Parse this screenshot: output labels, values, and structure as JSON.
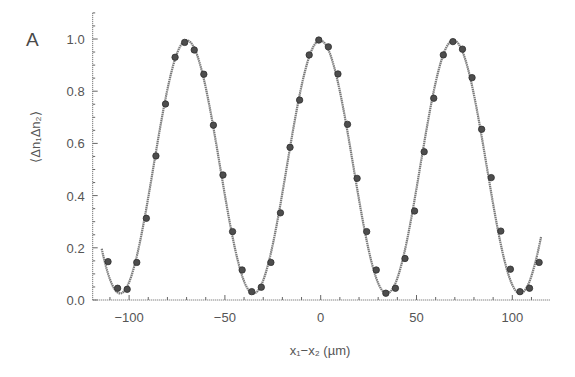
{
  "panel_label": "A",
  "chart_data": {
    "type": "scatter",
    "title": "",
    "xlabel": "x₁−x₂ (µm)",
    "ylabel": "⟨Δn₁Δn₂⟩",
    "xlim": [
      -119,
      120
    ],
    "ylim": [
      0,
      1.1
    ],
    "grid": false,
    "legend": null,
    "x_ticks": [
      -100,
      -50,
      0,
      50,
      100
    ],
    "x_tick_labels": [
      "−100",
      "−50",
      "0",
      "50",
      "100"
    ],
    "y_ticks": [
      0.0,
      0.2,
      0.4,
      0.6,
      0.8,
      1.0
    ],
    "y_tick_labels": [
      "0.0",
      "0.2",
      "0.4",
      "0.6",
      "0.8",
      "1.0"
    ],
    "series": [
      {
        "name": "measured",
        "style": "markers",
        "x": [
          -111,
          -106,
          -101,
          -96,
          -91,
          -86,
          -81,
          -76,
          -71,
          -66,
          -61,
          -56,
          -51,
          -46,
          -41,
          -36,
          -31,
          -26,
          -21,
          -16,
          -11,
          -6,
          -1,
          4,
          9,
          14,
          19,
          24,
          29,
          34,
          39,
          44,
          49,
          54,
          59,
          64,
          69,
          74,
          79,
          84,
          89,
          94,
          99,
          104,
          109,
          114
        ],
        "y": [
          0.147,
          0.045,
          0.041,
          0.144,
          0.313,
          0.552,
          0.751,
          0.93,
          0.987,
          0.958,
          0.865,
          0.67,
          0.479,
          0.262,
          0.115,
          0.032,
          0.049,
          0.144,
          0.334,
          0.585,
          0.766,
          0.939,
          0.996,
          0.97,
          0.866,
          0.673,
          0.466,
          0.262,
          0.115,
          0.026,
          0.045,
          0.159,
          0.341,
          0.568,
          0.773,
          0.939,
          0.99,
          0.961,
          0.852,
          0.654,
          0.469,
          0.264,
          0.118,
          0.032,
          0.045,
          0.144
        ]
      },
      {
        "name": "fit",
        "style": "line",
        "model": "offset + amplitude * cos(2*pi*(x - x0)/period)",
        "params": {
          "offset": 0.51,
          "amplitude": 0.485,
          "period": 69.6,
          "x0": -0.3
        },
        "x_range": [
          -114.3,
          115
        ]
      }
    ]
  }
}
